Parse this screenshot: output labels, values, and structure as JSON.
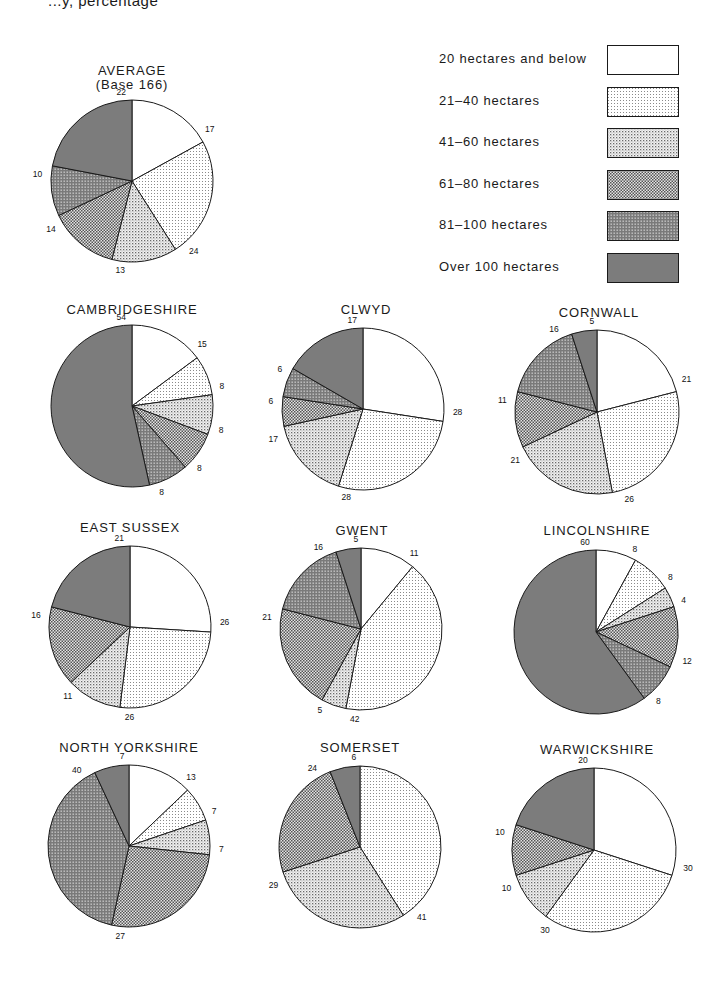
{
  "page": {
    "header_text": "...y, percentage"
  },
  "legend": {
    "items": [
      {
        "key": "le20",
        "label": "20 hectares and below"
      },
      {
        "key": "h21_40",
        "label": "21–40 hectares"
      },
      {
        "key": "h41_60",
        "label": "41–60 hectares"
      },
      {
        "key": "h61_80",
        "label": "61–80 hectares"
      },
      {
        "key": "h81_100",
        "label": "81–100 hectares"
      },
      {
        "key": "over100",
        "label": "Over 100 hectares"
      }
    ]
  },
  "colors": {
    "le20": "#ffffff",
    "h21_40": "#ececec",
    "h41_60": "#d6d6d6",
    "h61_80": "#b8b8b8",
    "h81_100": "#9a9a9a",
    "over100": "#7c7c7c",
    "outline": "#1a1a1a"
  },
  "charts": [
    {
      "title": "AVERAGE",
      "subtitle": "(Base 166)",
      "cx": 132,
      "cy": 181,
      "r": 81
    },
    {
      "title": "CAMBRIDGESHIRE",
      "cx": 132,
      "cy": 406,
      "r": 81
    },
    {
      "title": "CLWYD",
      "cx": 363,
      "cy": 409,
      "r": 81
    },
    {
      "title": "CORNWALL",
      "cx": 597,
      "cy": 412,
      "r": 82
    },
    {
      "title": "EAST SUSSEX",
      "cx": 130,
      "cy": 627,
      "r": 81
    },
    {
      "title": "GWENT",
      "cx": 361,
      "cy": 629,
      "r": 81
    },
    {
      "title": "LINCOLNSHIRE",
      "cx": 596,
      "cy": 632,
      "r": 82
    },
    {
      "title": "NORTH YORKSHIRE",
      "cx": 129,
      "cy": 846,
      "r": 81
    },
    {
      "title": "SOMERSET",
      "cx": 360,
      "cy": 847,
      "r": 81
    },
    {
      "title": "WARWICKSHIRE",
      "cx": 594,
      "cy": 850,
      "r": 82
    }
  ],
  "chart_data": {
    "type": "pie",
    "categories": [
      "20 hectares and below",
      "21–40 hectares",
      "41–60 hectares",
      "61–80 hectares",
      "81–100 hectares",
      "Over 100 hectares"
    ],
    "legend_position": "top-right",
    "series": [
      {
        "name": "AVERAGE (Base 166)",
        "values": [
          17,
          24,
          13,
          14,
          10,
          22
        ]
      },
      {
        "name": "CAMBRIDGESHIRE",
        "values": [
          15,
          8,
          8,
          8,
          8,
          54
        ]
      },
      {
        "name": "CLWYD",
        "values": [
          28,
          28,
          17,
          6,
          6,
          17
        ]
      },
      {
        "name": "CORNWALL",
        "values": [
          21,
          26,
          21,
          11,
          16,
          5
        ]
      },
      {
        "name": "EAST SUSSEX",
        "values": [
          26,
          26,
          11,
          16,
          0,
          21
        ]
      },
      {
        "name": "GWENT",
        "values": [
          11,
          42,
          5,
          21,
          16,
          5
        ]
      },
      {
        "name": "LINCOLNSHIRE",
        "values": [
          8,
          8,
          4,
          12,
          8,
          60
        ]
      },
      {
        "name": "NORTH YORKSHIRE",
        "values": [
          13,
          7,
          7,
          27,
          40,
          7
        ]
      },
      {
        "name": "SOMERSET",
        "values": [
          0,
          41,
          29,
          24,
          0,
          6
        ]
      },
      {
        "name": "WARWICKSHIRE",
        "values": [
          30,
          30,
          10,
          10,
          0,
          20
        ]
      }
    ]
  }
}
